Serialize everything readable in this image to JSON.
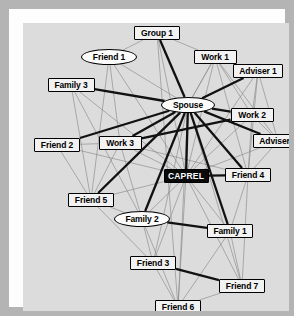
{
  "figure": {
    "canvas_background": "#dcdcdc",
    "frame_color": "#fdfdfd",
    "border_color": "#b4b4b4"
  },
  "legend": {
    "strong_tie_color": "#111111",
    "weak_tie_color": "#8a8a8a",
    "ego_fill": "#0a0a0a",
    "ego_text": "#ffffff",
    "node_fill": "#f2f2f2",
    "node_border": "#000000"
  },
  "chart_data": {
    "type": "diagram",
    "subtype": "social-network-graph",
    "node_count": 17,
    "edge_count": 62,
    "shapes": [
      "rect",
      "ellipse"
    ],
    "edge_weights": [
      "strong",
      "weak"
    ],
    "nodes": [
      {
        "id": "group1",
        "label": "Group 1",
        "shape": "rect",
        "x": 134,
        "y": 10,
        "w": 46,
        "h": 14
      },
      {
        "id": "friend1",
        "label": "Friend 1",
        "shape": "ellipse",
        "x": 86,
        "y": 34,
        "w": 56,
        "h": 16
      },
      {
        "id": "work1",
        "label": "Work 1",
        "shape": "rect",
        "x": 192,
        "y": 34,
        "w": 43,
        "h": 14
      },
      {
        "id": "adviser1",
        "label": "Adviser 1",
        "shape": "rect",
        "x": 235,
        "y": 48,
        "w": 50,
        "h": 14
      },
      {
        "id": "family3",
        "label": "Family 3",
        "shape": "rect",
        "x": 48,
        "y": 62,
        "w": 47,
        "h": 14
      },
      {
        "id": "spouse",
        "label": "Spouse",
        "shape": "ellipse",
        "x": 165,
        "y": 82,
        "w": 54,
        "h": 16
      },
      {
        "id": "work2",
        "label": "Work 2",
        "shape": "rect",
        "x": 229,
        "y": 92,
        "w": 43,
        "h": 14
      },
      {
        "id": "adviser2",
        "label": "Adviser 2",
        "shape": "rect",
        "x": 255,
        "y": 118,
        "w": 50,
        "h": 14
      },
      {
        "id": "friend2",
        "label": "Friend 2",
        "shape": "rect",
        "x": 34,
        "y": 122,
        "w": 46,
        "h": 14
      },
      {
        "id": "work3",
        "label": "Work 3",
        "shape": "rect",
        "x": 97,
        "y": 120,
        "w": 43,
        "h": 14
      },
      {
        "id": "caprel",
        "label": "CAPREL",
        "shape": "rect",
        "x": 163,
        "y": 153,
        "w": 45,
        "h": 14,
        "ego": true
      },
      {
        "id": "friend4",
        "label": "Friend 4",
        "shape": "rect",
        "x": 225,
        "y": 152,
        "w": 46,
        "h": 14
      },
      {
        "id": "friend5",
        "label": "Friend 5",
        "shape": "rect",
        "x": 68,
        "y": 177,
        "w": 46,
        "h": 14
      },
      {
        "id": "family2",
        "label": "Family 2",
        "shape": "ellipse",
        "x": 119,
        "y": 196,
        "w": 56,
        "h": 16
      },
      {
        "id": "family1",
        "label": "Family 1",
        "shape": "rect",
        "x": 207,
        "y": 208,
        "w": 46,
        "h": 14
      },
      {
        "id": "friend3",
        "label": "Friend 3",
        "shape": "rect",
        "x": 130,
        "y": 240,
        "w": 46,
        "h": 14
      },
      {
        "id": "friend7",
        "label": "Friend 7",
        "shape": "rect",
        "x": 219,
        "y": 263,
        "w": 46,
        "h": 14
      },
      {
        "id": "friend6",
        "label": "Friend 6",
        "shape": "rect",
        "x": 155,
        "y": 284,
        "w": 46,
        "h": 14
      }
    ],
    "edges": [
      {
        "source": "spouse",
        "target": "group1",
        "weight": "strong"
      },
      {
        "source": "spouse",
        "target": "adviser1",
        "weight": "strong"
      },
      {
        "source": "spouse",
        "target": "family3",
        "weight": "strong"
      },
      {
        "source": "spouse",
        "target": "friend2",
        "weight": "strong"
      },
      {
        "source": "spouse",
        "target": "work2",
        "weight": "strong"
      },
      {
        "source": "spouse",
        "target": "adviser2",
        "weight": "strong"
      },
      {
        "source": "spouse",
        "target": "work3",
        "weight": "strong"
      },
      {
        "source": "spouse",
        "target": "friend4",
        "weight": "strong"
      },
      {
        "source": "spouse",
        "target": "family2",
        "weight": "strong"
      },
      {
        "source": "spouse",
        "target": "family1",
        "weight": "strong"
      },
      {
        "source": "spouse",
        "target": "friend5",
        "weight": "strong"
      },
      {
        "source": "spouse",
        "target": "caprel",
        "weight": "strong"
      },
      {
        "source": "family2",
        "target": "family1",
        "weight": "strong"
      },
      {
        "source": "friend3",
        "target": "friend7",
        "weight": "strong"
      },
      {
        "source": "caprel",
        "target": "friend4",
        "weight": "strong"
      },
      {
        "source": "work2",
        "target": "work3",
        "weight": "strong"
      },
      {
        "source": "group1",
        "target": "friend1",
        "weight": "weak"
      },
      {
        "source": "group1",
        "target": "work1",
        "weight": "weak"
      },
      {
        "source": "group1",
        "target": "caprel",
        "weight": "weak"
      },
      {
        "source": "group1",
        "target": "friend6",
        "weight": "weak"
      },
      {
        "source": "friend1",
        "target": "spouse",
        "weight": "weak"
      },
      {
        "source": "friend1",
        "target": "work3",
        "weight": "weak"
      },
      {
        "source": "friend1",
        "target": "friend5",
        "weight": "weak"
      },
      {
        "source": "friend1",
        "target": "caprel",
        "weight": "weak"
      },
      {
        "source": "work1",
        "target": "spouse",
        "weight": "weak"
      },
      {
        "source": "work1",
        "target": "adviser1",
        "weight": "weak"
      },
      {
        "source": "work1",
        "target": "work2",
        "weight": "weak"
      },
      {
        "source": "work1",
        "target": "adviser2",
        "weight": "weak"
      },
      {
        "source": "work1",
        "target": "caprel",
        "weight": "weak"
      },
      {
        "source": "work1",
        "target": "friend4",
        "weight": "weak"
      },
      {
        "source": "adviser1",
        "target": "work2",
        "weight": "weak"
      },
      {
        "source": "adviser1",
        "target": "adviser2",
        "weight": "weak"
      },
      {
        "source": "adviser1",
        "target": "caprel",
        "weight": "weak"
      },
      {
        "source": "adviser1",
        "target": "friend4",
        "weight": "weak"
      },
      {
        "source": "family3",
        "target": "caprel",
        "weight": "weak"
      },
      {
        "source": "family3",
        "target": "family2",
        "weight": "weak"
      },
      {
        "source": "family3",
        "target": "friend5",
        "weight": "weak"
      },
      {
        "source": "friend2",
        "target": "work3",
        "weight": "weak"
      },
      {
        "source": "friend2",
        "target": "caprel",
        "weight": "weak"
      },
      {
        "source": "friend2",
        "target": "friend5",
        "weight": "weak"
      },
      {
        "source": "work2",
        "target": "adviser2",
        "weight": "weak"
      },
      {
        "source": "work2",
        "target": "caprel",
        "weight": "weak"
      },
      {
        "source": "work2",
        "target": "friend4",
        "weight": "weak"
      },
      {
        "source": "adviser2",
        "target": "caprel",
        "weight": "weak"
      },
      {
        "source": "adviser2",
        "target": "friend4",
        "weight": "weak"
      },
      {
        "source": "work3",
        "target": "caprel",
        "weight": "weak"
      },
      {
        "source": "work3",
        "target": "friend5",
        "weight": "weak"
      },
      {
        "source": "work3",
        "target": "family2",
        "weight": "weak"
      },
      {
        "source": "work3",
        "target": "friend4",
        "weight": "weak"
      },
      {
        "source": "caprel",
        "target": "friend5",
        "weight": "weak"
      },
      {
        "source": "caprel",
        "target": "family2",
        "weight": "weak"
      },
      {
        "source": "caprel",
        "target": "family1",
        "weight": "weak"
      },
      {
        "source": "caprel",
        "target": "friend3",
        "weight": "weak"
      },
      {
        "source": "caprel",
        "target": "friend7",
        "weight": "weak"
      },
      {
        "source": "caprel",
        "target": "friend6",
        "weight": "weak"
      },
      {
        "source": "friend4",
        "target": "family1",
        "weight": "weak"
      },
      {
        "source": "friend4",
        "target": "friend7",
        "weight": "weak"
      },
      {
        "source": "friend5",
        "target": "family2",
        "weight": "weak"
      },
      {
        "source": "friend5",
        "target": "friend3",
        "weight": "weak"
      },
      {
        "source": "family2",
        "target": "friend3",
        "weight": "weak"
      },
      {
        "source": "family2",
        "target": "friend6",
        "weight": "weak"
      },
      {
        "source": "family1",
        "target": "friend7",
        "weight": "weak"
      },
      {
        "source": "family1",
        "target": "friend6",
        "weight": "weak"
      },
      {
        "source": "friend3",
        "target": "friend6",
        "weight": "weak"
      },
      {
        "source": "friend7",
        "target": "friend6",
        "weight": "weak"
      },
      {
        "source": "spouse",
        "target": "friend3",
        "weight": "weak"
      },
      {
        "source": "spouse",
        "target": "friend6",
        "weight": "weak"
      },
      {
        "source": "spouse",
        "target": "friend7",
        "weight": "weak"
      },
      {
        "source": "spouse",
        "target": "work1",
        "weight": "weak"
      }
    ]
  }
}
